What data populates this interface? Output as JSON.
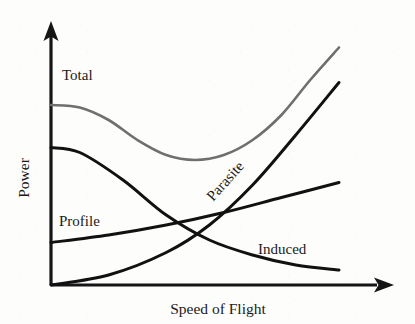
{
  "chart_data": {
    "type": "line",
    "title": "",
    "xlabel": "Speed of Flight",
    "ylabel": "Power",
    "grid": false,
    "legend_position": "inline-annotations",
    "axes": {
      "x_axis_has_arrow": true,
      "y_axis_has_arrow": true,
      "x_ticks": [],
      "y_ticks": [],
      "xlim": [
        0,
        1
      ],
      "ylim": [
        0,
        1
      ]
    },
    "series": [
      {
        "name": "Total",
        "color": "#6f6f6f",
        "stroke_width": 2.6,
        "note": "Sum of profile, parasite and induced power; high at low speed, dips to a minimum at mid speed, then climbs steeply.",
        "x": [
          0.0,
          0.1,
          0.2,
          0.3,
          0.4,
          0.5,
          0.6,
          0.7,
          0.8,
          0.9,
          1.0
        ],
        "y": [
          0.72,
          0.71,
          0.66,
          0.58,
          0.52,
          0.5,
          0.52,
          0.58,
          0.68,
          0.82,
          0.95
        ]
      },
      {
        "name": "Profile",
        "color": "#111111",
        "stroke_width": 3.0,
        "note": "Slowly rising, nearly straight line from a low value at zero speed.",
        "x": [
          0.0,
          0.2,
          0.4,
          0.6,
          0.8,
          1.0
        ],
        "y": [
          0.17,
          0.2,
          0.24,
          0.29,
          0.35,
          0.41
        ]
      },
      {
        "name": "Parasite",
        "color": "#111111",
        "stroke_width": 3.0,
        "note": "Zero at zero speed, increasing roughly with the cube of speed.",
        "x": [
          0.0,
          0.2,
          0.4,
          0.55,
          0.7,
          0.85,
          1.0
        ],
        "y": [
          0.0,
          0.04,
          0.13,
          0.24,
          0.4,
          0.6,
          0.81
        ]
      },
      {
        "name": "Induced",
        "color": "#111111",
        "stroke_width": 3.0,
        "note": "Very high at low speed, falling off and flattening toward a small value at high speed.",
        "x": [
          0.0,
          0.1,
          0.25,
          0.4,
          0.55,
          0.7,
          0.85,
          1.0
        ],
        "y": [
          0.55,
          0.53,
          0.42,
          0.28,
          0.18,
          0.12,
          0.08,
          0.06
        ]
      }
    ],
    "annotations": [
      {
        "label": "Total",
        "x_px": 62,
        "y_px": 80,
        "rotation": 0
      },
      {
        "label": "Profile",
        "x_px": 59,
        "y_px": 226,
        "rotation": 0
      },
      {
        "label": "Parasite",
        "x_px": 213,
        "y_px": 202,
        "rotation": -48
      },
      {
        "label": "Induced",
        "x_px": 258,
        "y_px": 254,
        "rotation": 0
      }
    ]
  },
  "figure": {
    "x_axis_label": "Speed of Flight",
    "y_axis_label": "Power",
    "curve_labels": {
      "total": "Total",
      "profile": "Profile",
      "parasite": "Parasite",
      "induced": "Induced"
    }
  }
}
